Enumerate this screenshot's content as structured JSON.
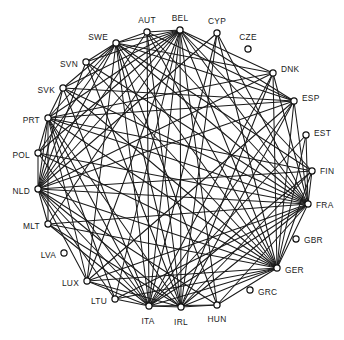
{
  "diagram": {
    "type": "network-graph",
    "layout": "circular",
    "title": "",
    "background_color": "#ffffff",
    "edge_color": "#1a1a1a",
    "node_fill_color": "#ffffff",
    "node_stroke_color": "#111111",
    "label_color": "#1a1a1a",
    "node_count": 24,
    "edge_count": 96,
    "isolated_nodes": [
      "CZE",
      "GBR",
      "GRC",
      "LVA"
    ],
    "nodes": [
      {
        "id": "AUT",
        "label": "AUT",
        "x": 147,
        "y": 32,
        "r": 3.1,
        "label_x": 147,
        "label_y": 21,
        "label_anchor": "middle"
      },
      {
        "id": "BEL",
        "label": "BEL",
        "x": 180,
        "y": 30,
        "r": 3.1,
        "label_x": 180,
        "label_y": 19,
        "label_anchor": "middle"
      },
      {
        "id": "CYP",
        "label": "CYP",
        "x": 217,
        "y": 33,
        "r": 3.1,
        "label_x": 217,
        "label_y": 22,
        "label_anchor": "middle"
      },
      {
        "id": "CZE",
        "label": "CZE",
        "x": 248,
        "y": 49,
        "r": 3.1,
        "label_x": 248,
        "label_y": 38,
        "label_anchor": "middle"
      },
      {
        "id": "DNK",
        "label": "DNK",
        "x": 273,
        "y": 73,
        "r": 3.1,
        "label_x": 281,
        "label_y": 70,
        "label_anchor": "start"
      },
      {
        "id": "ESP",
        "label": "ESP",
        "x": 294,
        "y": 101,
        "r": 3.1,
        "label_x": 302,
        "label_y": 99,
        "label_anchor": "start"
      },
      {
        "id": "EST",
        "label": "EST",
        "x": 306,
        "y": 135,
        "r": 3.1,
        "label_x": 314,
        "label_y": 134,
        "label_anchor": "start"
      },
      {
        "id": "FIN",
        "label": "FIN",
        "x": 312,
        "y": 171,
        "r": 3.1,
        "label_x": 320,
        "label_y": 172,
        "label_anchor": "start"
      },
      {
        "id": "FRA",
        "label": "FRA",
        "x": 308,
        "y": 204,
        "r": 3.1,
        "label_x": 316,
        "label_y": 206,
        "label_anchor": "start"
      },
      {
        "id": "GBR",
        "label": "GBR",
        "x": 296,
        "y": 239,
        "r": 3.1,
        "label_x": 304,
        "label_y": 241,
        "label_anchor": "start"
      },
      {
        "id": "GER",
        "label": "GER",
        "x": 277,
        "y": 268,
        "r": 3.1,
        "label_x": 285,
        "label_y": 271,
        "label_anchor": "start"
      },
      {
        "id": "GRC",
        "label": "GRC",
        "x": 250,
        "y": 290,
        "r": 3.1,
        "label_x": 258,
        "label_y": 293,
        "label_anchor": "start"
      },
      {
        "id": "HUN",
        "label": "HUN",
        "x": 217,
        "y": 305,
        "r": 3.1,
        "label_x": 217,
        "label_y": 320,
        "label_anchor": "middle"
      },
      {
        "id": "IRL",
        "label": "IRL",
        "x": 181,
        "y": 307,
        "r": 3.1,
        "label_x": 181,
        "label_y": 323,
        "label_anchor": "middle"
      },
      {
        "id": "ITA",
        "label": "ITA",
        "x": 149,
        "y": 306,
        "r": 3.1,
        "label_x": 148,
        "label_y": 322,
        "label_anchor": "middle"
      },
      {
        "id": "LTU",
        "label": "LTU",
        "x": 115,
        "y": 299,
        "r": 3.1,
        "label_x": 107,
        "label_y": 302,
        "label_anchor": "end"
      },
      {
        "id": "LUX",
        "label": "LUX",
        "x": 87,
        "y": 281,
        "r": 3.1,
        "label_x": 79,
        "label_y": 284,
        "label_anchor": "end"
      },
      {
        "id": "LVA",
        "label": "LVA",
        "x": 64,
        "y": 253,
        "r": 3.1,
        "label_x": 56,
        "label_y": 256,
        "label_anchor": "end"
      },
      {
        "id": "MLT",
        "label": "MLT",
        "x": 48,
        "y": 224,
        "r": 3.1,
        "label_x": 40,
        "label_y": 227,
        "label_anchor": "end"
      },
      {
        "id": "NLD",
        "label": "NLD",
        "x": 38,
        "y": 189,
        "r": 3.1,
        "label_x": 30,
        "label_y": 192,
        "label_anchor": "end"
      },
      {
        "id": "POL",
        "label": "POL",
        "x": 38,
        "y": 153,
        "r": 3.1,
        "label_x": 30,
        "label_y": 156,
        "label_anchor": "end"
      },
      {
        "id": "PRT",
        "label": "PRT",
        "x": 48,
        "y": 118,
        "r": 3.1,
        "label_x": 40,
        "label_y": 121,
        "label_anchor": "end"
      },
      {
        "id": "SVK",
        "label": "SVK",
        "x": 63,
        "y": 88,
        "r": 3.1,
        "label_x": 55,
        "label_y": 91,
        "label_anchor": "end"
      },
      {
        "id": "SVN",
        "label": "SVN",
        "x": 86,
        "y": 62,
        "r": 3.1,
        "label_x": 78,
        "label_y": 65,
        "label_anchor": "end"
      }
    ],
    "edges": [
      [
        "AUT",
        "BEL"
      ],
      [
        "AUT",
        "SWE"
      ],
      [
        "AUT",
        "NLD"
      ],
      [
        "AUT",
        "ITA"
      ],
      [
        "AUT",
        "IRL"
      ],
      [
        "AUT",
        "GER"
      ],
      [
        "AUT",
        "FRA"
      ],
      [
        "AUT",
        "ESP"
      ],
      [
        "BEL",
        "SWE"
      ],
      [
        "BEL",
        "SVN"
      ],
      [
        "BEL",
        "SVK"
      ],
      [
        "BEL",
        "PRT"
      ],
      [
        "BEL",
        "POL"
      ],
      [
        "BEL",
        "NLD"
      ],
      [
        "BEL",
        "MLT"
      ],
      [
        "BEL",
        "LUX"
      ],
      [
        "BEL",
        "LTU"
      ],
      [
        "BEL",
        "ITA"
      ],
      [
        "BEL",
        "IRL"
      ],
      [
        "BEL",
        "HUN"
      ],
      [
        "BEL",
        "GER"
      ],
      [
        "BEL",
        "FRA"
      ],
      [
        "BEL",
        "FIN"
      ],
      [
        "BEL",
        "ESP"
      ],
      [
        "BEL",
        "DNK"
      ],
      [
        "CYP",
        "ITA"
      ],
      [
        "CYP",
        "IRL"
      ],
      [
        "CYP",
        "GER"
      ],
      [
        "CYP",
        "FRA"
      ],
      [
        "CYP",
        "NLD"
      ],
      [
        "DNK",
        "SWE"
      ],
      [
        "DNK",
        "NLD"
      ],
      [
        "DNK",
        "ITA"
      ],
      [
        "DNK",
        "IRL"
      ],
      [
        "DNK",
        "GER"
      ],
      [
        "DNK",
        "FRA"
      ],
      [
        "DNK",
        "PRT"
      ],
      [
        "ESP",
        "SWE"
      ],
      [
        "ESP",
        "PRT"
      ],
      [
        "ESP",
        "NLD"
      ],
      [
        "ESP",
        "ITA"
      ],
      [
        "ESP",
        "IRL"
      ],
      [
        "ESP",
        "GER"
      ],
      [
        "ESP",
        "FRA"
      ],
      [
        "ESP",
        "LUX"
      ],
      [
        "ESP",
        "SVK"
      ],
      [
        "EST",
        "GER"
      ],
      [
        "EST",
        "FRA"
      ],
      [
        "EST",
        "ITA"
      ],
      [
        "FIN",
        "SWE"
      ],
      [
        "FIN",
        "NLD"
      ],
      [
        "FIN",
        "GER"
      ],
      [
        "FIN",
        "FRA"
      ],
      [
        "FIN",
        "ITA"
      ],
      [
        "FIN",
        "IRL"
      ],
      [
        "FIN",
        "PRT"
      ],
      [
        "FRA",
        "SWE"
      ],
      [
        "FRA",
        "SVN"
      ],
      [
        "FRA",
        "SVK"
      ],
      [
        "FRA",
        "PRT"
      ],
      [
        "FRA",
        "POL"
      ],
      [
        "FRA",
        "NLD"
      ],
      [
        "FRA",
        "MLT"
      ],
      [
        "FRA",
        "LUX"
      ],
      [
        "FRA",
        "LTU"
      ],
      [
        "FRA",
        "ITA"
      ],
      [
        "FRA",
        "IRL"
      ],
      [
        "FRA",
        "HUN"
      ],
      [
        "FRA",
        "GER"
      ],
      [
        "GER",
        "SWE"
      ],
      [
        "GER",
        "SVN"
      ],
      [
        "GER",
        "SVK"
      ],
      [
        "GER",
        "PRT"
      ],
      [
        "GER",
        "POL"
      ],
      [
        "GER",
        "NLD"
      ],
      [
        "GER",
        "MLT"
      ],
      [
        "GER",
        "LUX"
      ],
      [
        "GER",
        "LTU"
      ],
      [
        "GER",
        "ITA"
      ],
      [
        "GER",
        "IRL"
      ],
      [
        "GER",
        "HUN"
      ],
      [
        "HUN",
        "ITA"
      ],
      [
        "HUN",
        "IRL"
      ],
      [
        "HUN",
        "NLD"
      ],
      [
        "HUN",
        "SWE"
      ],
      [
        "IRL",
        "SWE"
      ],
      [
        "IRL",
        "SVN"
      ],
      [
        "IRL",
        "PRT"
      ],
      [
        "IRL",
        "NLD"
      ],
      [
        "IRL",
        "LUX"
      ],
      [
        "IRL",
        "ITA"
      ],
      [
        "IRL",
        "MLT"
      ],
      [
        "ITA",
        "SWE"
      ],
      [
        "ITA",
        "SVK"
      ],
      [
        "ITA",
        "PRT"
      ],
      [
        "ITA",
        "POL"
      ],
      [
        "ITA",
        "NLD"
      ],
      [
        "ITA",
        "LUX"
      ],
      [
        "ITA",
        "LTU"
      ],
      [
        "ITA",
        "MLT"
      ],
      [
        "LTU",
        "NLD"
      ],
      [
        "LTU",
        "PRT"
      ],
      [
        "LUX",
        "NLD"
      ],
      [
        "LUX",
        "PRT"
      ],
      [
        "LUX",
        "SWE"
      ],
      [
        "MLT",
        "NLD"
      ],
      [
        "MLT",
        "PRT"
      ],
      [
        "NLD",
        "SWE"
      ],
      [
        "NLD",
        "SVN"
      ],
      [
        "NLD",
        "SVK"
      ],
      [
        "NLD",
        "PRT"
      ],
      [
        "NLD",
        "POL"
      ],
      [
        "POL",
        "PRT"
      ],
      [
        "POL",
        "SWE"
      ],
      [
        "PRT",
        "SWE"
      ],
      [
        "PRT",
        "SVK"
      ],
      [
        "SVK",
        "SWE"
      ],
      [
        "SVN",
        "SWE"
      ]
    ],
    "extra_nodes": [
      {
        "id": "SWE",
        "label": "SWE",
        "x": 116,
        "y": 43,
        "r": 3.1,
        "label_x": 108,
        "label_y": 38,
        "label_anchor": "end"
      }
    ]
  }
}
